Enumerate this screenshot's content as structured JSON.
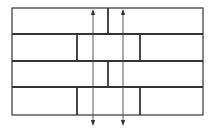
{
  "diagram": {
    "type": "brick-bond",
    "colors": {
      "background": "#ffffff",
      "stroke": "#333333",
      "thin_stroke": "#444444"
    },
    "frame": {
      "x1": 12,
      "x2": 203,
      "y_top": 8,
      "y_bottom": 115
    },
    "courses": [
      {
        "index": 1,
        "y_top": 8,
        "y_bottom": 34,
        "joints_x": [
          108
        ]
      },
      {
        "index": 2,
        "y_top": 34,
        "y_bottom": 61,
        "joints_x": [
          77,
          140
        ]
      },
      {
        "index": 3,
        "y_top": 61,
        "y_bottom": 87,
        "joints_x": [
          108
        ]
      },
      {
        "index": 4,
        "y_top": 87,
        "y_bottom": 115,
        "joints_x": [
          77,
          140
        ]
      }
    ],
    "arrows": [
      {
        "name": "left-arrow",
        "x": 93,
        "y_start": 9,
        "y_end": 126,
        "heads": "both"
      },
      {
        "name": "right-arrow",
        "x": 123,
        "y_start": 9,
        "y_end": 126,
        "heads": "both"
      }
    ]
  }
}
